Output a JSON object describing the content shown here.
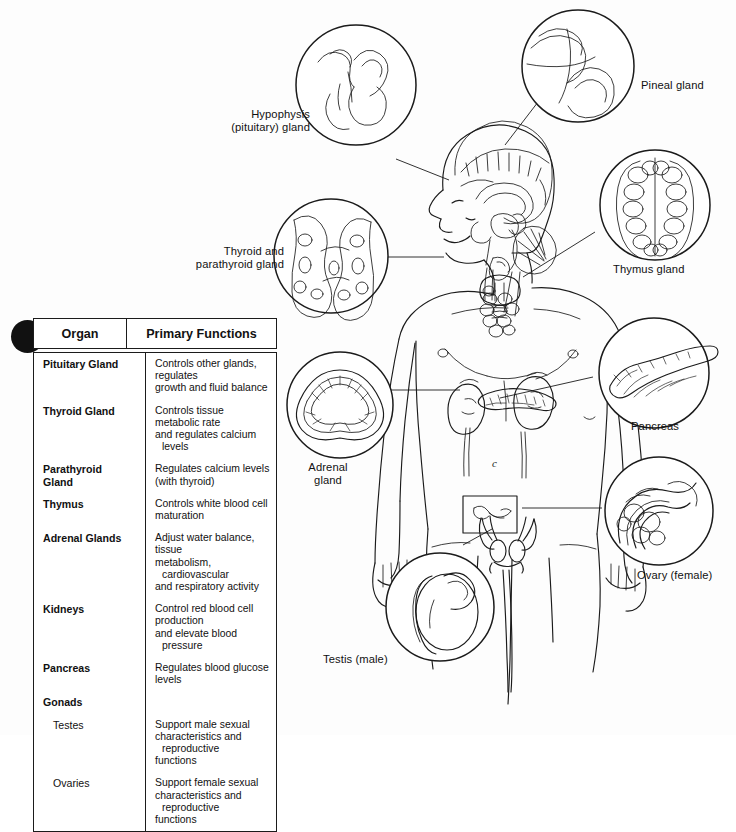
{
  "figure": {
    "body_annotation": "c",
    "background_color": "#fdfdfd",
    "ink_color": "#1b1b1b"
  },
  "callouts": [
    {
      "name": "hypophysis",
      "label": "Hypophysis\n(pituitary) gland",
      "align": "right",
      "x": 214,
      "y": 108,
      "w": 96
    },
    {
      "name": "pineal",
      "label": "Pineal gland",
      "align": "left",
      "x": 641,
      "y": 79,
      "w": 96
    },
    {
      "name": "thyroid",
      "label": "Thyroid and\nparathyroid gland",
      "align": "right",
      "x": 178,
      "y": 245,
      "w": 106
    },
    {
      "name": "thymus",
      "label": "Thymus gland",
      "align": "left",
      "x": 613,
      "y": 263,
      "w": 100
    },
    {
      "name": "adrenal",
      "label": "Adrenal\ngland",
      "align": "center",
      "x": 295,
      "y": 461,
      "w": 66
    },
    {
      "name": "pancreas",
      "label": "Pancreas",
      "align": "left",
      "x": 631,
      "y": 420,
      "w": 90
    },
    {
      "name": "ovary",
      "label": "Ovary (female)",
      "align": "left",
      "x": 637,
      "y": 569,
      "w": 100
    },
    {
      "name": "testis",
      "label": "Testis (male)",
      "align": "left",
      "x": 323,
      "y": 653,
      "w": 92
    }
  ],
  "table": {
    "headers": {
      "organ": "Organ",
      "functions": "Primary Functions"
    },
    "rows": [
      {
        "organ": "Pituitary Gland",
        "sub": false,
        "functions": [
          "Controls other glands, regulates",
          "growth and fluid balance"
        ]
      },
      {
        "organ": "Thyroid Gland",
        "sub": false,
        "functions": [
          "Controls tissue metabolic rate",
          "and regulates calcium levels"
        ]
      },
      {
        "organ": "Parathyroid\nGland",
        "sub": false,
        "functions": [
          "Regulates calcium levels",
          "(with thyroid)"
        ]
      },
      {
        "organ": "Thymus",
        "sub": false,
        "functions": [
          "Controls white blood cell",
          "maturation"
        ]
      },
      {
        "organ": "Adrenal Glands",
        "sub": false,
        "functions": [
          "Adjust water balance, tissue",
          "metabolism, cardiovascular",
          "and respiratory activity"
        ]
      },
      {
        "organ": "Kidneys",
        "sub": false,
        "functions": [
          "Control red blood cell production",
          "and elevate blood pressure"
        ]
      },
      {
        "organ": "Pancreas",
        "sub": false,
        "functions": [
          "Regulates blood glucose levels"
        ]
      },
      {
        "organ": "Gonads",
        "sub": false,
        "functions": []
      },
      {
        "organ": "Testes",
        "sub": true,
        "functions": [
          "Support male sexual",
          "characteristics and reproductive",
          "functions"
        ]
      },
      {
        "organ": "Ovaries",
        "sub": true,
        "functions": [
          "Support female sexual",
          "characteristics and reproductive",
          "functions"
        ]
      }
    ]
  }
}
